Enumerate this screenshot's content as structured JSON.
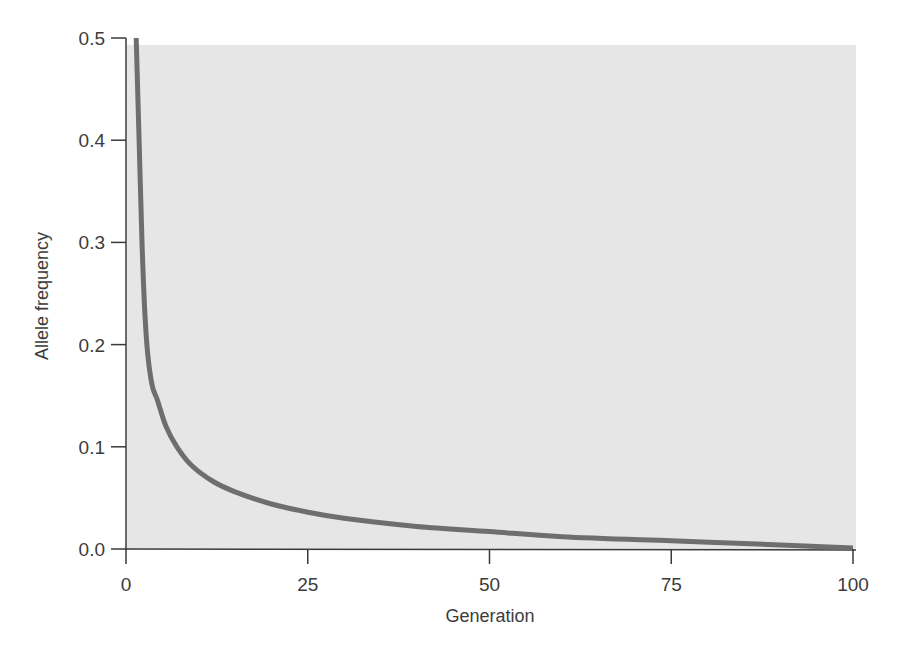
{
  "chart_data": {
    "type": "line",
    "title": "",
    "xlabel": "Generation",
    "ylabel": "Allele frequency",
    "xlim": [
      0,
      100
    ],
    "ylim": [
      0,
      0.5
    ],
    "grid": false,
    "legend": null,
    "x_ticks": [
      "0",
      "25",
      "50",
      "75",
      "100"
    ],
    "y_ticks": [
      "0.0",
      "0.1",
      "0.2",
      "0.3",
      "0.4",
      "0.5"
    ],
    "series": [
      {
        "name": "Allele frequency",
        "color": "#6e6e6e",
        "x": [
          1.4,
          1.8,
          2.2,
          2.6,
          3.0,
          3.6,
          4.3,
          5.5,
          7.0,
          9.0,
          12.0,
          15.0,
          20.0,
          25.0,
          30.0,
          40.0,
          50.0,
          60.0,
          75.0,
          90.0,
          100.0
        ],
        "y": [
          0.5,
          0.4,
          0.3,
          0.23,
          0.19,
          0.16,
          0.146,
          0.12,
          0.1,
          0.082,
          0.066,
          0.056,
          0.044,
          0.036,
          0.03,
          0.022,
          0.017,
          0.012,
          0.008,
          0.004,
          0.001
        ]
      }
    ]
  },
  "colors": {
    "plot_background": "#e6e6e6",
    "axis": "#3a3a3a",
    "curve": "#6e6e6e"
  }
}
